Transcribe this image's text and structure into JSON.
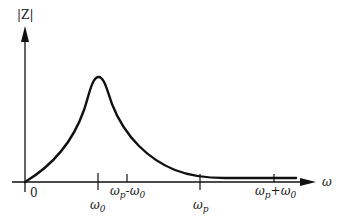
{
  "diagram": {
    "y_axis_label": "|Z|",
    "x_axis_label": "ω",
    "origin_label": "0",
    "ticks": [
      {
        "id": "w0",
        "base": "ω",
        "sub": "0",
        "suffix": "",
        "suffix_base": "",
        "suffix_sub": ""
      },
      {
        "id": "wp-w0",
        "base": "ω",
        "sub": "p",
        "suffix": "-",
        "suffix_base": "ω",
        "suffix_sub": "0"
      },
      {
        "id": "wp",
        "base": "ω",
        "sub": "p",
        "suffix": "",
        "suffix_base": "",
        "suffix_sub": ""
      },
      {
        "id": "wp+w0",
        "base": "ω",
        "sub": "p",
        "suffix": "+",
        "suffix_base": "ω",
        "suffix_sub": "0"
      }
    ],
    "curve_description": "Impedance magnitude |Z| vs frequency ω: rises from 0 to a peak at ω0, then decays to near-zero plateau beyond ωp",
    "colors": {
      "line": "#111111",
      "background": "#ffffff"
    }
  }
}
